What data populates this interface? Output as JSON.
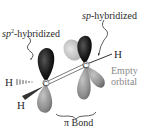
{
  "diagram": {
    "labels": {
      "sp2": {
        "prefix": "sp",
        "sup": "2",
        "suffix": "-hybridized"
      },
      "sp": {
        "prefix": "sp",
        "suffix": "-hybridized"
      },
      "h_right": "H",
      "h_left": "H",
      "h_bottom": "H",
      "empty_line1": "Empty",
      "empty_line2": "orbital",
      "pi_bond": "π Bond",
      "carbon_left": "C",
      "carbon_right": "C"
    },
    "colors": {
      "filled_lobe": "#1a1a1a",
      "empty_lobe": "#9a9a9a",
      "light_lobe": "#c8c8c8",
      "text": "#2a2a2a",
      "gray_text": "#8a8a8a"
    }
  }
}
